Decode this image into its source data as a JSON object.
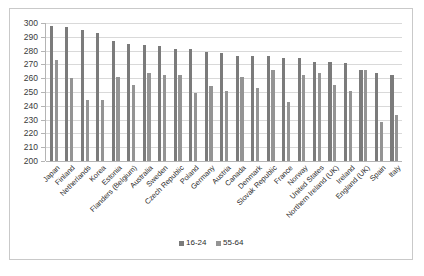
{
  "chart_data": {
    "type": "bar",
    "title": "",
    "xlabel": "",
    "ylabel": "",
    "ylim": [
      200,
      300
    ],
    "ytick_step": 10,
    "yticks": [
      300,
      290,
      280,
      270,
      260,
      250,
      240,
      230,
      220,
      210,
      200
    ],
    "grid": true,
    "legend_position": "bottom",
    "orientation": "vertical",
    "categories": [
      "Japan",
      "Finland",
      "Netherlands",
      "Korea",
      "Estonia",
      "Flanders (Belgium)",
      "Australia",
      "Sweden",
      "Czech Republic",
      "Poland",
      "Germany",
      "Austria",
      "Canada",
      "Denmark",
      "Slovak Republic",
      "France",
      "Norway",
      "United States",
      "Northern Ireland (UK)",
      "Ireland",
      "England (UK)",
      "Spain",
      "Italy"
    ],
    "series": [
      {
        "name": "16-24",
        "color": "#7b7b7b",
        "values": [
          298,
          297,
          295,
          293,
          287,
          285,
          284,
          283,
          281,
          281,
          279,
          278,
          276,
          276,
          276,
          275,
          275,
          272,
          272,
          271,
          266,
          264,
          262
        ]
      },
      {
        "name": "55-64",
        "color": "#949494",
        "values": [
          273,
          260,
          244,
          244,
          261,
          255,
          264,
          262,
          262,
          249,
          254,
          251,
          261,
          253,
          266,
          243,
          262,
          264,
          255,
          251,
          266,
          228,
          233
        ]
      }
    ]
  },
  "legend": {
    "items": [
      {
        "label": "16-24",
        "color": "#7b7b7b"
      },
      {
        "label": "55-64",
        "color": "#949494"
      }
    ]
  }
}
